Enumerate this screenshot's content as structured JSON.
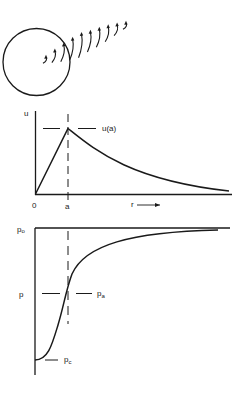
{
  "figure": {
    "top_illustration": {
      "description": "sphere with curved arrows radiating outward",
      "arrow_count": 10
    },
    "velocity_plot": {
      "y_label": "u",
      "peak_label": "u(a)",
      "origin_label": "0",
      "x_tick_label": "a",
      "x_axis_label": "r",
      "x_axis_arrow": "right-arrow"
    },
    "pressure_plot": {
      "top_label_main": "p",
      "top_label_sub": "o",
      "mid_label": "p",
      "mid_right_label_main": "p",
      "mid_right_label_sub": "a",
      "bottom_label_main": "p",
      "bottom_label_sub": "c"
    }
  },
  "colors": {
    "ink": "#1a1a1a",
    "background": "#ffffff"
  }
}
